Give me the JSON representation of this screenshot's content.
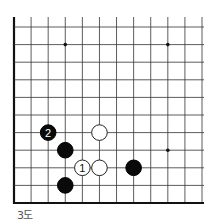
{
  "diagram": {
    "caption": "3도",
    "board": {
      "type": "go-board-corner",
      "visible_columns": 12,
      "visible_rows": 11,
      "edges": [
        "left",
        "bottom"
      ],
      "line_color": "#333333",
      "edge_color": "#111111",
      "star_points": [
        {
          "col": 3,
          "row": 1
        },
        {
          "col": 9,
          "row": 1
        },
        {
          "col": 9,
          "row": 7
        }
      ],
      "stones": [
        {
          "color": "black",
          "col": 2,
          "row": 6,
          "label": "2"
        },
        {
          "color": "white",
          "col": 5,
          "row": 6,
          "label": ""
        },
        {
          "color": "black",
          "col": 3,
          "row": 7,
          "label": ""
        },
        {
          "color": "white",
          "col": 4,
          "row": 8,
          "label": "1"
        },
        {
          "color": "white",
          "col": 5,
          "row": 8,
          "label": ""
        },
        {
          "color": "black",
          "col": 7,
          "row": 8,
          "label": ""
        },
        {
          "color": "black",
          "col": 3,
          "row": 9,
          "label": ""
        }
      ]
    }
  }
}
